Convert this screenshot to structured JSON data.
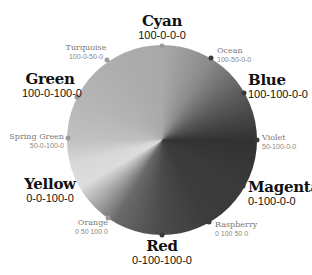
{
  "diagram": {
    "colors": [
      {
        "name": "Cyan",
        "code": "100-0-0-0",
        "rank": "major"
      },
      {
        "name": "Ocean",
        "code": "100-50-0-0",
        "rank": "minor"
      },
      {
        "name": "Blue",
        "code": "100-100-0-0",
        "rank": "major"
      },
      {
        "name": "Violet",
        "code": "50-100-0-0",
        "rank": "minor"
      },
      {
        "name": "Magenta",
        "code": "0-100-0-0",
        "rank": "major"
      },
      {
        "name": "Raspberry",
        "code": "0 100 50 0",
        "rank": "minor"
      },
      {
        "name": "Red",
        "code": "0-100-100-0",
        "rank": "major"
      },
      {
        "name": "Orange",
        "code": "0 50 100 0",
        "rank": "minor"
      },
      {
        "name": "Yellow",
        "code": "0-0-100-0",
        "rank": "major"
      },
      {
        "name": "Spring Green",
        "code": "50-0-100-0",
        "rank": "minor"
      },
      {
        "name": "Green",
        "code": "100-0-100-0",
        "rank": "major"
      },
      {
        "name": "Turquoise",
        "code": "100-0-50-0",
        "rank": "minor"
      }
    ]
  }
}
